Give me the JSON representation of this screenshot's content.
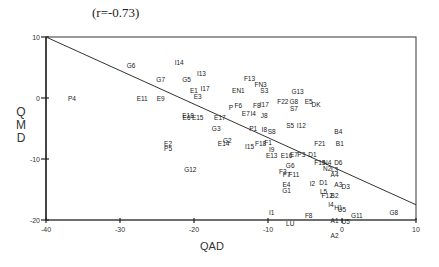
{
  "chart_data": {
    "type": "scatter",
    "title": "(r=-0.73)",
    "xlabel": "QAD",
    "ylabel": "QMD",
    "xlim": [
      -40,
      10
    ],
    "ylim": [
      -20,
      10
    ],
    "xticks": [
      -40,
      -30,
      -20,
      -10,
      0,
      10
    ],
    "yticks": [
      10,
      0,
      -10,
      -20
    ],
    "grid": false,
    "legend": "none",
    "regression_line": {
      "x": [
        -40,
        10
      ],
      "y": [
        10,
        -17.5
      ]
    },
    "points": [
      {
        "label": "P4",
        "x": -36.5,
        "y": 0
      },
      {
        "label": "G6",
        "x": -28.5,
        "y": 5.3
      },
      {
        "label": "I14",
        "x": -22,
        "y": 5.8
      },
      {
        "label": "G7",
        "x": -24.5,
        "y": 3
      },
      {
        "label": "G5",
        "x": -21,
        "y": 3
      },
      {
        "label": "I13",
        "x": -19,
        "y": 4
      },
      {
        "label": "E11",
        "x": -27,
        "y": -0.1
      },
      {
        "label": "E9",
        "x": -24.5,
        "y": -0.1
      },
      {
        "label": "E1",
        "x": -20,
        "y": 1.3
      },
      {
        "label": "I17",
        "x": -18.5,
        "y": 1.5
      },
      {
        "label": "E3",
        "x": -19.5,
        "y": 0.3
      },
      {
        "label": "E18",
        "x": -20.8,
        "y": -2.8
      },
      {
        "label": "E6",
        "x": -21,
        "y": -3.2
      },
      {
        "label": "E15",
        "x": -19.5,
        "y": -3.2
      },
      {
        "label": "E17",
        "x": -16.5,
        "y": -3.2
      },
      {
        "label": "G3",
        "x": -17,
        "y": -5
      },
      {
        "label": "G2",
        "x": -15.5,
        "y": -7
      },
      {
        "label": "E14",
        "x": -16,
        "y": -7.5
      },
      {
        "label": "E2",
        "x": -23.5,
        "y": -7.5
      },
      {
        "label": "P5",
        "x": -23.5,
        "y": -8.3
      },
      {
        "label": "G12",
        "x": -20.5,
        "y": -11.8
      },
      {
        "label": "F13",
        "x": -12.5,
        "y": 3.2
      },
      {
        "label": "FN3",
        "x": -11,
        "y": 2.2
      },
      {
        "label": "S3",
        "x": -10.5,
        "y": 1.2
      },
      {
        "label": "EN1",
        "x": -14,
        "y": 1.2
      },
      {
        "label": "P",
        "x": -15,
        "y": -1.5
      },
      {
        "label": "F6",
        "x": -14,
        "y": -1.3
      },
      {
        "label": "F8",
        "x": -11.5,
        "y": -1.3
      },
      {
        "label": "I17b",
        "x": -10.5,
        "y": -1
      },
      {
        "label": "E7",
        "x": -13,
        "y": -2.5
      },
      {
        "label": "I4",
        "x": -12,
        "y": -2.5
      },
      {
        "label": "J8",
        "x": -10.5,
        "y": -2.8
      },
      {
        "label": "G13",
        "x": -6,
        "y": 1
      },
      {
        "label": "F22",
        "x": -8,
        "y": -0.5
      },
      {
        "label": "G8",
        "x": -6.5,
        "y": -0.5
      },
      {
        "label": "S7",
        "x": -6.5,
        "y": -1.7
      },
      {
        "label": "E5",
        "x": -4.5,
        "y": -0.5
      },
      {
        "label": "DK",
        "x": -3.5,
        "y": -1
      },
      {
        "label": "P1",
        "x": -12,
        "y": -5
      },
      {
        "label": "I8",
        "x": -10.5,
        "y": -5.2
      },
      {
        "label": "S8",
        "x": -9.5,
        "y": -5.5
      },
      {
        "label": "S5",
        "x": -7,
        "y": -4.5
      },
      {
        "label": "I12",
        "x": -5.5,
        "y": -4.5
      },
      {
        "label": "F21",
        "x": -3,
        "y": -7.5
      },
      {
        "label": "F1",
        "x": -10,
        "y": -7.3
      },
      {
        "label": "F18",
        "x": -11,
        "y": -7.5
      },
      {
        "label": "I15",
        "x": -12.5,
        "y": -8
      },
      {
        "label": "I9",
        "x": -9.5,
        "y": -8.5
      },
      {
        "label": "E13",
        "x": -9.5,
        "y": -9.5
      },
      {
        "label": "E16",
        "x": -7.5,
        "y": -9.5
      },
      {
        "label": "E7b",
        "x": -6.5,
        "y": -9.3
      },
      {
        "label": "P3",
        "x": -5.5,
        "y": -9.3
      },
      {
        "label": "D1",
        "x": -4,
        "y": -9.3
      },
      {
        "label": "B4",
        "x": -0.5,
        "y": -5.5
      },
      {
        "label": "B1",
        "x": -0.3,
        "y": -7.5
      },
      {
        "label": "F15",
        "x": -3,
        "y": -10.5
      },
      {
        "label": "N4",
        "x": -2,
        "y": -10.5
      },
      {
        "label": "D6",
        "x": -0.5,
        "y": -10.5
      },
      {
        "label": "N2",
        "x": -2,
        "y": -11.5
      },
      {
        "label": "L3",
        "x": -1,
        "y": -11.8
      },
      {
        "label": "A4",
        "x": -1,
        "y": -12.5
      },
      {
        "label": "G6b",
        "x": -7,
        "y": -11
      },
      {
        "label": "F3",
        "x": -8,
        "y": -12
      },
      {
        "label": "F7",
        "x": -7.5,
        "y": -12.5
      },
      {
        "label": "F11",
        "x": -6.5,
        "y": -12.5
      },
      {
        "label": "E4",
        "x": -7.5,
        "y": -14.2
      },
      {
        "label": "I2",
        "x": -4,
        "y": -14
      },
      {
        "label": "D1b",
        "x": -2.5,
        "y": -13.8
      },
      {
        "label": "A3",
        "x": -0.5,
        "y": -14.2
      },
      {
        "label": "D3",
        "x": 0.5,
        "y": -14.5
      },
      {
        "label": "G1",
        "x": -7.5,
        "y": -15.2
      },
      {
        "label": "L5",
        "x": -2.5,
        "y": -15.3
      },
      {
        "label": "F12",
        "x": -2,
        "y": -16
      },
      {
        "label": "B2",
        "x": -1,
        "y": -16
      },
      {
        "label": "I1",
        "x": -9.5,
        "y": -18.7
      },
      {
        "label": "F8b",
        "x": -4.5,
        "y": -19.2
      },
      {
        "label": "I4b",
        "x": -1.5,
        "y": -17.5
      },
      {
        "label": "H1",
        "x": -0.5,
        "y": -18
      },
      {
        "label": "U5",
        "x": 0,
        "y": -18.2
      },
      {
        "label": "G11",
        "x": 2,
        "y": -19.2
      },
      {
        "label": "A1",
        "x": -1,
        "y": -20
      },
      {
        "label": "U5b",
        "x": 0.5,
        "y": -20.2
      },
      {
        "label": "LU",
        "x": -7,
        "y": -20.6
      },
      {
        "label": "A2",
        "x": -1,
        "y": -22.5
      },
      {
        "label": "G8b",
        "x": 7,
        "y": -18.8
      }
    ]
  },
  "labels": {
    "title": "(r=-0.73)",
    "ylabel_letters": [
      "Q",
      "M",
      "D"
    ],
    "xlabel": "QAD"
  },
  "axis_ticks": {
    "x": [
      "-40",
      "-30",
      "-20",
      "-10",
      "0",
      "10"
    ],
    "y": [
      "10",
      "0",
      "-10",
      "-20"
    ]
  }
}
